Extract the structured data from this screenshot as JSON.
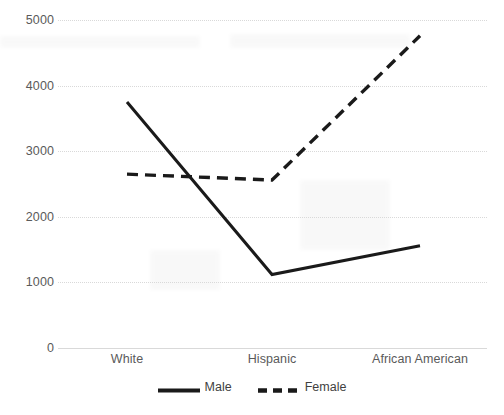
{
  "chart_data": {
    "type": "line",
    "title": "",
    "xlabel": "",
    "ylabel": "",
    "categories": [
      "White",
      "Hispanic",
      "African American"
    ],
    "series": [
      {
        "name": "Male",
        "style": "solid",
        "color": "#1a1a1a",
        "values": [
          3750,
          1120,
          1560
        ]
      },
      {
        "name": "Female",
        "style": "dashed",
        "color": "#1a1a1a",
        "values": [
          2650,
          2560,
          4760
        ]
      }
    ],
    "ylim": [
      0,
      5000
    ],
    "yticks": [
      0,
      1000,
      2000,
      3000,
      4000,
      5000
    ],
    "ytick_labels": [
      "0",
      "1000",
      "2000",
      "3000",
      "4000",
      "5000"
    ],
    "grid": true,
    "grid_axis": "y",
    "grid_style": "dotted",
    "grid_color": "#d9d9d9",
    "legend_position": "bottom-center",
    "legend_entries": [
      "Male",
      "Female"
    ],
    "axis_line_color": "#d9d9d9",
    "tick_label_color": "#5a5a5a",
    "background": "#ffffff"
  }
}
